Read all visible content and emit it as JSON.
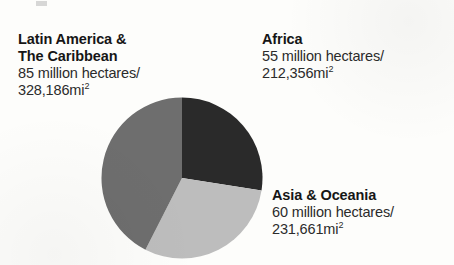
{
  "chart_data": {
    "type": "pie",
    "title": "",
    "subtitle": "",
    "xlabel": "",
    "ylabel": "",
    "legend_position": "callout-labels",
    "grid": false,
    "units": "million hectares",
    "total_value": 200,
    "start_angle_deg": 0,
    "direction": "clockwise",
    "categories": [
      "Africa",
      "Asia & Oceania",
      "Latin America & The Caribbean"
    ],
    "values": [
      55,
      60,
      85
    ],
    "slices": [
      {
        "name": "Africa",
        "label_line1": "Africa",
        "label_line2": "55 million hectares/",
        "label_line3": "212,356mi",
        "label_line3_sup": "2",
        "value": 55,
        "unit": "million hectares",
        "area_sq_mi": "212,356",
        "share_pct": 27.5,
        "angle_deg": 99,
        "color": "#2a2a2a"
      },
      {
        "name": "Asia & Oceania",
        "label_line1": "Asia & Oceania",
        "label_line2": "60 million hectares/",
        "label_line3": "231,661mi",
        "label_line3_sup": "2",
        "value": 60,
        "unit": "million hectares",
        "area_sq_mi": "231,661",
        "share_pct": 30.0,
        "angle_deg": 108,
        "color": "#bdbdbd"
      },
      {
        "name": "Latin America & The Caribbean",
        "label_line1": "Latin America &",
        "label_line1b": "The Caribbean",
        "label_line2": "85 million hectares/",
        "label_line3": "328,186mi",
        "label_line3_sup": "2",
        "value": 85,
        "unit": "million hectares",
        "area_sq_mi": "328,186",
        "share_pct": 42.5,
        "angle_deg": 153,
        "color": "#6e6e6e"
      }
    ]
  },
  "labels": {
    "latin_america": {
      "title_line1": "Latin America &",
      "title_line2": "The Caribbean",
      "value_line1": "85 million hectares/",
      "value_line2": "328,186mi",
      "value_sup": "2"
    },
    "africa": {
      "title_line1": "Africa",
      "value_line1": "55 million hectares/",
      "value_line2": "212,356mi",
      "value_sup": "2"
    },
    "asia_oceania": {
      "title_line1": "Asia & Oceania",
      "value_line1": "60 million hectares/",
      "value_line2": "231,661mi",
      "value_sup": "2"
    }
  },
  "colors": {
    "africa_slice": "#2a2a2a",
    "asia_slice": "#bdbdbd",
    "latin_america_slice": "#6e6e6e",
    "background": "#fdfdfb",
    "text": "#1d1d1d"
  }
}
